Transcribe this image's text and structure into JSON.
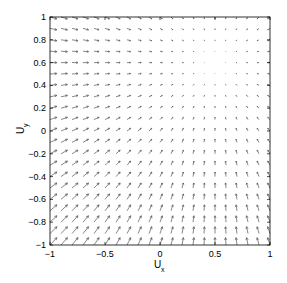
{
  "chart_data": {
    "type": "quiver",
    "title": "",
    "xlabel": "U",
    "xlabel_sub": "x",
    "ylabel": "U",
    "ylabel_sub": "y",
    "xlim": [
      -1,
      1
    ],
    "ylim": [
      -1,
      1
    ],
    "grid": false,
    "legend": null,
    "xticks": [
      -1,
      -0.5,
      0,
      0.5,
      1
    ],
    "xtick_labels": [
      "-1",
      "-0.5",
      "0",
      "0.5",
      "1"
    ],
    "yticks": [
      -1,
      -0.8,
      -0.6,
      -0.4,
      -0.2,
      0,
      0.2,
      0.4,
      0.6,
      0.8,
      1
    ],
    "ytick_labels": [
      "-1",
      "-0.8",
      "-0.6",
      "-0.4",
      "-0.2",
      "0",
      "0.2",
      "0.4",
      "0.6",
      "0.8",
      "1"
    ],
    "grid_points": {
      "x_start": -1,
      "x_end": 1,
      "step": 0.1,
      "y_start": -1,
      "y_end": 1
    },
    "field": {
      "description": "Vector field converging toward an equilibrium near (0.5, 0.6)",
      "equilibrium": [
        0.5,
        0.6
      ],
      "u_expr": "0.5 - x",
      "v_expr": "0.6 - y"
    },
    "arrow_color": "#555555",
    "frame_color": "#000000"
  }
}
